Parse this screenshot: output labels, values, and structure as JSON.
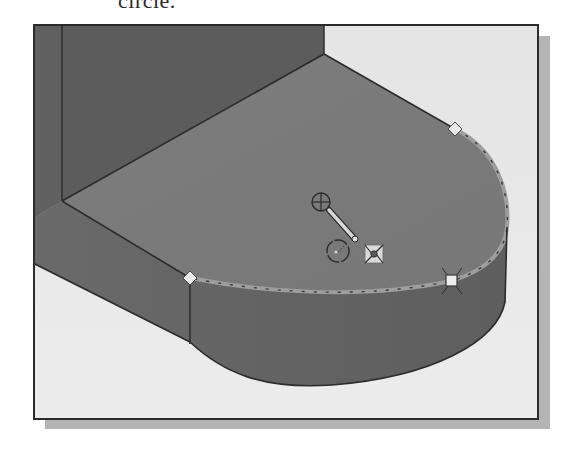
{
  "caption": {
    "text": "circle."
  },
  "viewport": {
    "description": "3D CAD model view - extruded slot-shaped solid with rounded end, sketching a circle on top face",
    "colors": {
      "background": "#e6e6e6",
      "back_wall": "#5a5a5a",
      "top_face": "#7a7a7a",
      "side_face": "#666666",
      "edge": "#2b2b2b",
      "frame": "#2b2b2b",
      "shadow": "#b4b4b4",
      "highlight_edge": "#a8a8a8"
    }
  },
  "markers": {
    "circle_center_handle": "circle-center-crosshair",
    "radius_drag_handle": "radius-drag-handle",
    "small_circle_preview": "circle-preview",
    "inference_icon": "tangent-inference-icon",
    "vertex_top_right": "diamond-vertex-handle",
    "vertex_front_left": "diamond-vertex-handle",
    "vertex_front_right": "square-endpoint-handle"
  }
}
